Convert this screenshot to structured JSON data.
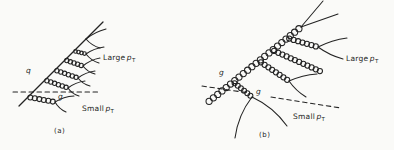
{
  "colors": {
    "ink": "#232323",
    "background": "#fafaf8"
  },
  "panel_a": {
    "caption": "(a)",
    "quark_label": "q",
    "soft_gluon_label": "g",
    "large_pt": {
      "prefix": "Large",
      "symbol": "p",
      "subscript": "T"
    },
    "small_pt": {
      "prefix": "Small",
      "symbol": "p",
      "subscript": "T"
    }
  },
  "panel_b": {
    "caption": "(b)",
    "gluon_label": "g",
    "soft_gluon_label": "g",
    "large_pt": {
      "prefix": "Large",
      "symbol": "p",
      "subscript": "T"
    },
    "small_pt": {
      "prefix": "Small",
      "symbol": "p",
      "subscript": "T"
    }
  }
}
